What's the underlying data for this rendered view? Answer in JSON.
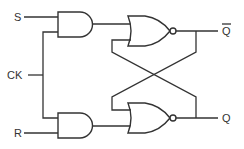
{
  "diagram": {
    "type": "clocked SR latch (logic circuit)",
    "colors": {
      "line": "#333333",
      "background": "#ffffff"
    },
    "inputs": [
      {
        "id": "S",
        "label": "S"
      },
      {
        "id": "CK",
        "label": "CK"
      },
      {
        "id": "R",
        "label": "R"
      }
    ],
    "outputs": [
      {
        "id": "Qbar",
        "label": "Q",
        "overline": true
      },
      {
        "id": "Q",
        "label": "Q",
        "overline": false
      }
    ],
    "gates": [
      {
        "id": "and-top",
        "kind": "AND",
        "inputs": [
          "S",
          "CK"
        ]
      },
      {
        "id": "and-bottom",
        "kind": "AND",
        "inputs": [
          "CK",
          "R"
        ]
      },
      {
        "id": "nor-top",
        "kind": "NOR",
        "inputs": [
          "and-top",
          "nor-bottom"
        ],
        "output": "Qbar"
      },
      {
        "id": "nor-bottom",
        "kind": "NOR",
        "inputs": [
          "nor-top",
          "and-bottom"
        ],
        "output": "Q"
      }
    ]
  }
}
